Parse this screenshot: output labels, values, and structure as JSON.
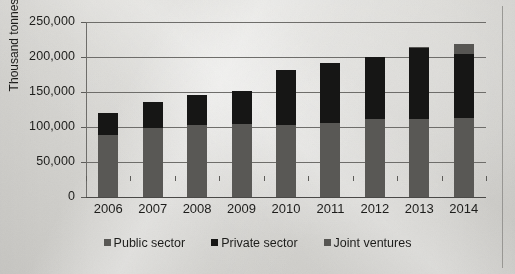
{
  "chart_data": {
    "type": "bar",
    "subtype": "stacked-bar",
    "title": "",
    "xlabel": "",
    "ylabel": "Thousand tonnes",
    "ylim": [
      0,
      250000
    ],
    "ytick_step": 50000,
    "ytick_labels": [
      "250,000",
      "200,000",
      "150,000",
      "100,000",
      "50,000",
      "0"
    ],
    "ytick_values": [
      250000,
      200000,
      150000,
      100000,
      50000,
      0
    ],
    "grid": true,
    "legend_position": "bottom",
    "categories": [
      "2006",
      "2007",
      "2008",
      "2009",
      "2010",
      "2011",
      "2012",
      "2013",
      "2014"
    ],
    "series": [
      {
        "name": "Public sector",
        "color": "#595855",
        "values": [
          89000,
          99000,
          103000,
          104000,
          103000,
          106000,
          112000,
          112000,
          113000
        ]
      },
      {
        "name": "Private sector",
        "color": "#161615",
        "values": [
          31000,
          37000,
          43000,
          47000,
          78000,
          85000,
          88000,
          101000,
          92000
        ]
      },
      {
        "name": "Joint ventures",
        "color": "#575653",
        "values": [
          0,
          0,
          0,
          0,
          0,
          0,
          0,
          2000,
          13000
        ]
      }
    ],
    "totals": [
      120000,
      136000,
      146000,
      151000,
      181000,
      191000,
      200000,
      215000,
      218000
    ]
  },
  "legend": {
    "items": [
      {
        "label": "Public sector",
        "swatch": "public-swatch"
      },
      {
        "label": "Private sector",
        "swatch": "private-swatch"
      },
      {
        "label": "Joint ventures",
        "swatch": "joint-swatch"
      }
    ]
  },
  "axes": {
    "y_title": "Thousand tonnes"
  }
}
